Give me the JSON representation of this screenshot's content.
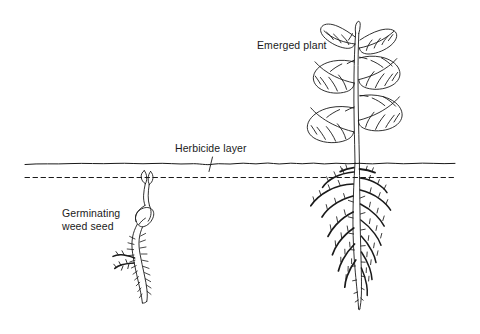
{
  "figure": {
    "background_color": "#ffffff",
    "ink_color": "#1a1a1a",
    "width": 480,
    "height": 334
  },
  "labels": {
    "emerged_plant": "Emerged plant",
    "herbicide_layer": "Herbicide layer",
    "germinating_weed_seed": "Germinating\nweed seed"
  },
  "elements": {
    "soil_surface_line": "soil-surface-line",
    "herbicide_layer_line": "herbicide-layer-dashed-line",
    "leader_tick": "herbicide-layer-leader-tick",
    "emerged_plant": "emerged-plant-drawing",
    "emerged_plant_roots": "emerged-plant-root-system",
    "seedling": "germinating-weed-seed-drawing",
    "seedling_roots": "germinating-weed-seed-root"
  },
  "diagram_data": {
    "type": "schematic-cross-section",
    "subject": "Soil profile showing a herbicide layer just below the soil surface",
    "soil_surface_y": 163,
    "herbicide_layer_y": 177,
    "items": [
      {
        "name": "Emerged plant",
        "position_x": 358,
        "description": "Large broadleaf plant with stem and leaves above soil, taproot with many lateral roots below, root system passes through the herbicide layer",
        "status": "emerged above soil surface"
      },
      {
        "name": "Germinating weed seed",
        "position_x": 148,
        "description": "Small seedling with two cotyledons just reaching the herbicide layer, seed coat and short root below",
        "status": "shoot tip at herbicide layer depth"
      }
    ]
  }
}
